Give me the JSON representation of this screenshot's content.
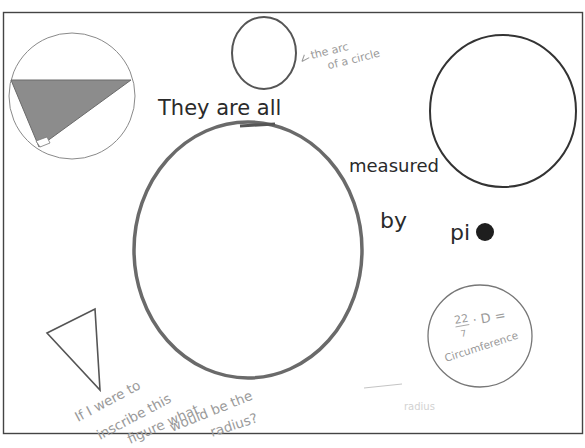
{
  "poster": {
    "background": "#ffffff",
    "border_color": "#444444",
    "ink_color": "#2a2a2a",
    "pencil_color": "#6a6a6a",
    "shade_color": "#8c8c8c",
    "faint_color": "#9a9a9a"
  },
  "headline": {
    "line1": "They are all",
    "line2": "measured",
    "line3_word1": "by",
    "line3_word2": "pi"
  },
  "annotations": {
    "arc_label_line1": "the arc",
    "arc_label_line2": "of a circle",
    "formula_numerator": "22",
    "formula_denominator": "7",
    "formula_rest": "· D =",
    "formula_result": "Circumference",
    "question_lines": [
      "If I were to",
      "inscribe this",
      "figure what",
      "would be the",
      "radius?"
    ],
    "erased_text": "radius"
  },
  "shapes": [
    {
      "name": "inscribed-triangle-circle",
      "type": "circle-with-shaded-right-triangle"
    },
    {
      "name": "small-circle",
      "type": "circle"
    },
    {
      "name": "large-central-circle",
      "type": "circle"
    },
    {
      "name": "right-circle",
      "type": "circle"
    },
    {
      "name": "formula-circle",
      "type": "circle"
    },
    {
      "name": "triangle",
      "type": "triangle"
    },
    {
      "name": "pi-dot",
      "type": "filled-dot"
    }
  ]
}
